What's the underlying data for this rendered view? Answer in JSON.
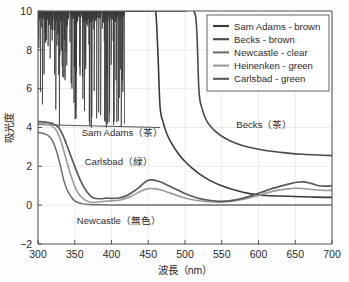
{
  "figure": {
    "background": "#fdfdfd",
    "plot_background": "#ffffff",
    "axis_color": "#555555",
    "grid_color": "#dddddd",
    "text_color": "#2b2b2b"
  },
  "chart_data": {
    "type": "line",
    "title": "",
    "xlabel": "波長（nm）",
    "ylabel": "吸光度",
    "xlim": [
      300,
      700
    ],
    "ylim": [
      -2,
      10
    ],
    "xticks": [
      300,
      350,
      400,
      450,
      500,
      550,
      600,
      650,
      700
    ],
    "yticks": [
      -2,
      0,
      2,
      4,
      6,
      8,
      10
    ],
    "grid": true,
    "legend_position": "top-right",
    "series": [
      {
        "name": "Sam Adams - brown",
        "color": "#3a3a3a",
        "width": 1.6,
        "noisy": true,
        "noise_x_end": 418,
        "x": [
          300,
          305,
          310,
          315,
          320,
          330,
          340,
          350,
          360,
          370,
          380,
          390,
          400,
          410,
          418,
          430,
          445,
          455,
          460,
          463,
          466,
          470,
          475,
          480,
          490,
          500,
          510,
          520,
          535,
          550,
          570,
          590,
          610,
          630,
          650,
          670,
          690,
          700
        ],
        "y": [
          10,
          10,
          10,
          10,
          10,
          10,
          10,
          10,
          10,
          10,
          10,
          10,
          10,
          10,
          10,
          10,
          10,
          10,
          10,
          8.0,
          5.1,
          4.3,
          3.7,
          3.3,
          2.7,
          2.25,
          1.9,
          1.6,
          1.25,
          1.0,
          0.75,
          0.58,
          0.5,
          0.47,
          0.45,
          0.42,
          0.4,
          0.4
        ]
      },
      {
        "name": "Becks - brown",
        "color": "#4a4a4a",
        "width": 1.6,
        "noisy": false,
        "x": [
          300,
          350,
          400,
          450,
          480,
          500,
          512,
          516,
          519,
          523,
          530,
          540,
          550,
          565,
          580,
          600,
          620,
          640,
          660,
          680,
          700
        ],
        "y": [
          10,
          10,
          10,
          10,
          10,
          10,
          10,
          9.0,
          5.9,
          5.0,
          4.3,
          3.85,
          3.55,
          3.25,
          3.05,
          2.88,
          2.76,
          2.68,
          2.62,
          2.58,
          2.55
        ]
      },
      {
        "name": "Newcastle - clear",
        "color": "#6e6e6e",
        "width": 1.5,
        "noisy": false,
        "x": [
          300,
          305,
          310,
          315,
          320,
          325,
          330,
          335,
          340,
          350,
          360,
          370,
          380,
          400,
          450,
          500,
          550,
          600,
          650,
          700
        ],
        "y": [
          3.75,
          3.72,
          3.66,
          3.55,
          3.3,
          2.8,
          2.1,
          1.3,
          0.75,
          0.22,
          0.08,
          0.03,
          0.02,
          0.01,
          0.01,
          0.01,
          0.01,
          0.01,
          0.01,
          0.01
        ]
      },
      {
        "name": "Heinenken - green",
        "color": "#9a9a9a",
        "width": 1.6,
        "noisy": false,
        "x": [
          300,
          310,
          318,
          325,
          332,
          338,
          345,
          352,
          360,
          370,
          380,
          390,
          400,
          410,
          420,
          430,
          440,
          450,
          460,
          470,
          480,
          495,
          510,
          525,
          540,
          550,
          565,
          580,
          595,
          610,
          625,
          640,
          650,
          660,
          670,
          680,
          690,
          700
        ],
        "y": [
          4.2,
          4.18,
          4.1,
          3.85,
          3.2,
          2.4,
          1.5,
          0.8,
          0.38,
          0.16,
          0.15,
          0.2,
          0.22,
          0.25,
          0.35,
          0.52,
          0.72,
          0.85,
          0.84,
          0.75,
          0.62,
          0.42,
          0.28,
          0.2,
          0.16,
          0.15,
          0.2,
          0.3,
          0.45,
          0.62,
          0.76,
          0.84,
          0.87,
          0.86,
          0.82,
          0.78,
          0.76,
          0.76
        ]
      },
      {
        "name": "Carlsbad - green",
        "color": "#5a5a5a",
        "width": 1.7,
        "noisy": false,
        "x": [
          300,
          310,
          320,
          328,
          335,
          342,
          350,
          358,
          366,
          375,
          385,
          392,
          400,
          410,
          420,
          430,
          440,
          448,
          455,
          465,
          475,
          490,
          505,
          520,
          535,
          548,
          560,
          575,
          590,
          605,
          618,
          630,
          642,
          652,
          662,
          672,
          682,
          692,
          700
        ],
        "y": [
          4.3,
          4.28,
          4.2,
          4.0,
          3.5,
          2.8,
          2.0,
          1.25,
          0.72,
          0.38,
          0.33,
          0.36,
          0.35,
          0.37,
          0.48,
          0.7,
          1.0,
          1.25,
          1.3,
          1.22,
          1.05,
          0.78,
          0.52,
          0.34,
          0.24,
          0.2,
          0.22,
          0.32,
          0.48,
          0.68,
          0.85,
          0.98,
          1.1,
          1.18,
          1.2,
          1.12,
          1.0,
          0.98,
          1.0
        ]
      }
    ],
    "annotations": [
      {
        "text": "Sam Adams（茶）",
        "x": 415,
        "y": 3.55,
        "anchor": "middle"
      },
      {
        "text": "Becks（茶）",
        "x": 608,
        "y": 3.95,
        "anchor": "middle"
      },
      {
        "text": "Carlsbad（緑）",
        "x": 410,
        "y": 2.05,
        "anchor": "middle"
      },
      {
        "text": "Newcastle（無色）",
        "x": 410,
        "y": -0.95,
        "anchor": "middle"
      }
    ]
  },
  "legend": {
    "items": [
      {
        "label": "Sam Adams - brown",
        "color": "#3a3a3a"
      },
      {
        "label": "Becks - brown",
        "color": "#4a4a4a"
      },
      {
        "label": "Newcastle - clear",
        "color": "#6e6e6e"
      },
      {
        "label": "Heinenken - green",
        "color": "#9a9a9a"
      },
      {
        "label": "Carlsbad - green",
        "color": "#5a5a5a"
      }
    ]
  }
}
